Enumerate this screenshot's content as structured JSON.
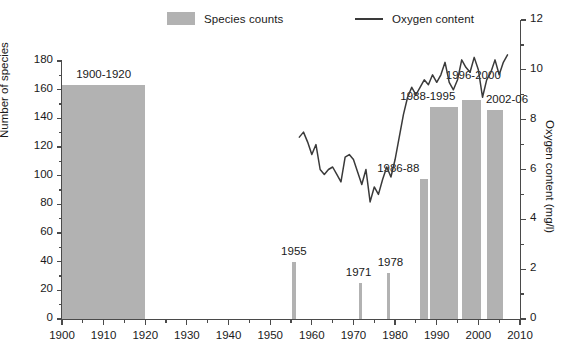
{
  "legend": {
    "items": [
      {
        "label": "Species counts",
        "type": "swatch",
        "color": "#b2b2b2"
      },
      {
        "label": "Oxygen content",
        "type": "line",
        "color": "#3a3a3a"
      }
    ]
  },
  "chart_data": {
    "type": "bar",
    "title": "",
    "xlabel": "",
    "ylabel": "Number of species",
    "y2label": "Oxygen content (mg/l)",
    "xlim": [
      1900,
      2010
    ],
    "ylim": [
      0,
      180
    ],
    "y2lim": [
      0,
      12
    ],
    "xticks": [
      1900,
      1910,
      1920,
      1930,
      1940,
      1950,
      1960,
      1970,
      1980,
      1990,
      2000,
      2010
    ],
    "xticklabels": [
      "1900",
      "1910",
      "1920",
      "1930",
      "1940",
      "1950",
      "1960",
      "1970",
      "1980",
      "1990",
      "2000",
      "2010"
    ],
    "xminorticks": [
      1905,
      1915,
      1925,
      1935,
      1945,
      1955,
      1965,
      1975,
      1985,
      1995,
      2005
    ],
    "yticks": [
      0,
      20,
      40,
      60,
      80,
      100,
      120,
      140,
      160,
      180
    ],
    "yticklabels": [
      "0",
      "20",
      "40",
      "60",
      "80",
      "100",
      "120",
      "140",
      "160",
      "180"
    ],
    "y2ticks": [
      0,
      2,
      4,
      6,
      8,
      10,
      12
    ],
    "y2ticklabels": [
      "0",
      "2",
      "4",
      "6",
      "8",
      "10",
      "12"
    ],
    "y2minorticks": [
      1,
      3,
      5,
      7,
      9,
      11
    ],
    "grid": false,
    "legend_position": "top",
    "bar_color": "#b2b2b2",
    "line_color": "#3a3a3a",
    "bars": [
      {
        "label": "1900-1920",
        "start": 1900,
        "end": 1920,
        "value": 163
      },
      {
        "label": "1955",
        "start": 1955.3,
        "end": 1956.1,
        "value": 40
      },
      {
        "label": "1971",
        "start": 1971.3,
        "end": 1972.1,
        "value": 25
      },
      {
        "label": "1978",
        "start": 1978.0,
        "end": 1978.8,
        "value": 32
      },
      {
        "label": "1986-88",
        "start": 1986,
        "end": 1988,
        "value": 98
      },
      {
        "label": "1988-1995",
        "start": 1988.4,
        "end": 1995,
        "value": 148
      },
      {
        "label": "1996-2000",
        "start": 1996,
        "end": 2000.6,
        "value": 153
      },
      {
        "label": "2002-06",
        "start": 2002,
        "end": 2006,
        "value": 146
      }
    ],
    "oxygen_series": {
      "name": "Oxygen content",
      "unit": "mg/l",
      "x": [
        1957,
        1958,
        1959,
        1960,
        1961,
        1962,
        1963,
        1964,
        1965,
        1966,
        1967,
        1968,
        1969,
        1970,
        1971,
        1972,
        1973,
        1974,
        1975,
        1976,
        1977,
        1978,
        1979,
        1980,
        1981,
        1982,
        1983,
        1984,
        1985,
        1986,
        1987,
        1988,
        1989,
        1990,
        1991,
        1992,
        1993,
        1994,
        1995,
        1996,
        1997,
        1998,
        1999,
        2000,
        2001,
        2002,
        2003,
        2004,
        2005,
        2006,
        2007
      ],
      "y": [
        7.3,
        7.5,
        7.1,
        6.6,
        7.0,
        6.0,
        5.8,
        6.0,
        6.1,
        5.8,
        5.5,
        6.5,
        6.6,
        6.4,
        5.9,
        5.4,
        6.0,
        4.7,
        5.3,
        5.0,
        5.6,
        6.1,
        5.7,
        6.4,
        7.3,
        8.2,
        8.9,
        9.3,
        9.0,
        9.3,
        9.6,
        9.4,
        9.8,
        9.5,
        9.8,
        10.3,
        9.5,
        9.2,
        9.6,
        10.4,
        10.1,
        9.9,
        10.5,
        10.0,
        8.9,
        9.6,
        9.9,
        10.4,
        9.8,
        10.3,
        10.6
      ]
    }
  }
}
